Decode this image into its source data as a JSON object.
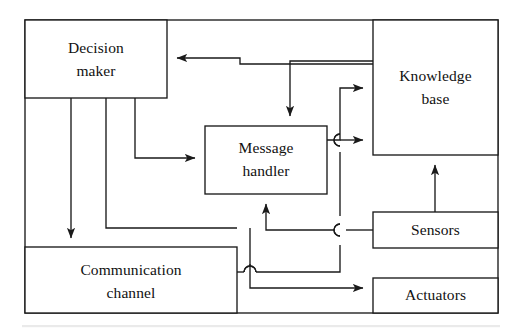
{
  "diagram": {
    "type": "block-diagram",
    "stroke_color": "#1a1a1a",
    "fill_color": "#ffffff",
    "background": "#ffffff",
    "frame": {
      "label": "outer-agent-boundary",
      "x": 25,
      "y": 20,
      "width": 473,
      "height": 293
    },
    "nodes": [
      {
        "id": "decision-maker",
        "line1": "Decision",
        "line2": "maker",
        "x": 25,
        "y": 20,
        "width": 142,
        "height": 78
      },
      {
        "id": "knowledge-base",
        "line1": "Knowledge",
        "line2": "base",
        "x": 373,
        "y": 20,
        "width": 125,
        "height": 135
      },
      {
        "id": "message-handler",
        "line1": "Message",
        "line2": "handler",
        "x": 205,
        "y": 126,
        "width": 122,
        "height": 68
      },
      {
        "id": "sensors",
        "line1": "Sensors",
        "line2": "",
        "x": 373,
        "y": 212,
        "width": 125,
        "height": 36
      },
      {
        "id": "communication-channel",
        "line1": "Communication",
        "line2": "channel",
        "x": 25,
        "y": 247,
        "width": 212,
        "height": 66
      },
      {
        "id": "actuators",
        "line1": "Actuators",
        "line2": "",
        "x": 373,
        "y": 278,
        "width": 125,
        "height": 35
      }
    ],
    "edges": [
      {
        "id": "kb-to-decision-maker",
        "from": "knowledge-base",
        "to": "decision-maker",
        "arrow": "left"
      },
      {
        "id": "decision-maker-to-msg",
        "from": "decision-maker",
        "to": "message-handler",
        "arrow": "right"
      },
      {
        "id": "decision-maker-to-comm",
        "from": "decision-maker",
        "to": "communication-channel",
        "arrow": "down"
      },
      {
        "id": "kb-top-to-msg",
        "from": "knowledge-base",
        "to": "message-handler",
        "arrow": "down"
      },
      {
        "id": "msg-to-kb-upper",
        "from": "message-handler",
        "to": "knowledge-base",
        "arrow": "right"
      },
      {
        "id": "msg-to-kb-lower",
        "from": "message-handler",
        "to": "knowledge-base",
        "arrow": "right"
      },
      {
        "id": "sensors-to-kb",
        "from": "sensors",
        "to": "knowledge-base",
        "arrow": "up"
      },
      {
        "id": "sensors-to-msg",
        "from": "sensors",
        "to": "message-handler",
        "arrow": "up"
      },
      {
        "id": "comm-to-msg",
        "from": "communication-channel",
        "to": "message-handler",
        "arrow": "up"
      },
      {
        "id": "msg-to-actuators",
        "from": "message-handler",
        "to": "actuators",
        "arrow": "right"
      }
    ]
  }
}
